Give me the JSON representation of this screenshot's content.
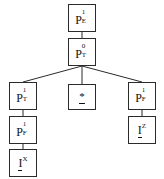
{
  "diagram": {
    "type": "parse-tree",
    "title": "",
    "background_color": "#ffffff",
    "node_border_color": "#2b2b2b",
    "text_color": "#111111",
    "nodes": [
      {
        "id": "n_root",
        "label": "P1E",
        "base": "P",
        "superscript": "1",
        "subscript": "E",
        "underbar": false,
        "x": 68,
        "y": 4,
        "w": 28,
        "h": 28
      },
      {
        "id": "n_pt0",
        "label": "P0T",
        "base": "P",
        "superscript": "0",
        "subscript": "T",
        "underbar": false,
        "x": 68,
        "y": 38,
        "w": 28,
        "h": 28
      },
      {
        "id": "n_pt1",
        "label": "P1T",
        "base": "P",
        "superscript": "1",
        "subscript": "T",
        "underbar": false,
        "x": 9,
        "y": 82,
        "w": 28,
        "h": 28
      },
      {
        "id": "n_star",
        "label": "*",
        "base": "*",
        "superscript": "",
        "subscript": "",
        "underbar": true,
        "x": 68,
        "y": 84,
        "w": 28,
        "h": 26
      },
      {
        "id": "n_pf1r",
        "label": "P1F",
        "base": "P",
        "superscript": "1",
        "subscript": "F",
        "underbar": false,
        "x": 128,
        "y": 82,
        "w": 28,
        "h": 28
      },
      {
        "id": "n_pf1l",
        "label": "P1F",
        "base": "P",
        "superscript": "1",
        "subscript": "F",
        "underbar": false,
        "x": 9,
        "y": 116,
        "w": 28,
        "h": 28
      },
      {
        "id": "n_iz",
        "label": "IZ",
        "base": "I",
        "superscript": "Z",
        "subscript": "",
        "underbar": true,
        "x": 128,
        "y": 116,
        "w": 28,
        "h": 28
      },
      {
        "id": "n_ix",
        "label": "IX",
        "base": "I",
        "superscript": "X",
        "subscript": "",
        "underbar": true,
        "x": 9,
        "y": 149,
        "w": 28,
        "h": 28
      }
    ],
    "edges": [
      {
        "from": "n_root",
        "to": "n_pt0",
        "x1": 82,
        "y1": 32,
        "x2": 82,
        "y2": 38
      },
      {
        "from": "n_pt0",
        "to": "n_pt1",
        "x1": 82,
        "y1": 66,
        "x2": 23,
        "y2": 82
      },
      {
        "from": "n_pt0",
        "to": "n_star",
        "x1": 82,
        "y1": 66,
        "x2": 82,
        "y2": 84
      },
      {
        "from": "n_pt0",
        "to": "n_pf1r",
        "x1": 82,
        "y1": 66,
        "x2": 142,
        "y2": 82
      },
      {
        "from": "n_pt1",
        "to": "n_pf1l",
        "x1": 23,
        "y1": 110,
        "x2": 23,
        "y2": 116
      },
      {
        "from": "n_pf1l",
        "to": "n_ix",
        "x1": 23,
        "y1": 144,
        "x2": 23,
        "y2": 149
      },
      {
        "from": "n_pf1r",
        "to": "n_iz",
        "x1": 142,
        "y1": 110,
        "x2": 142,
        "y2": 116
      }
    ]
  }
}
